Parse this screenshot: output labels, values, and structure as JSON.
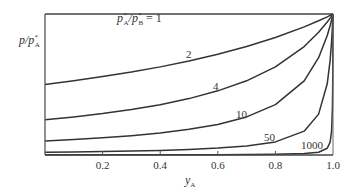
{
  "chart_data": {
    "type": "line",
    "title": "",
    "xlabel": "y_A",
    "xlabel_main": "y",
    "xlabel_sub": "A",
    "ylabel": "p/p*_A",
    "xlim": [
      0,
      1.0
    ],
    "ylim": [
      0,
      1.0
    ],
    "grid": false,
    "legend": "none (curves labelled inline)",
    "x_ticks": [
      0.2,
      0.4,
      0.6,
      0.8,
      1.0
    ],
    "x_tick_labels": [
      "0.2",
      "0.4",
      "0.6",
      "0.8",
      "1.0"
    ],
    "x": [
      0,
      0.1,
      0.2,
      0.3,
      0.4,
      0.5,
      0.6,
      0.7,
      0.8,
      0.9,
      0.95,
      0.98,
      0.99,
      0.995,
      0.998,
      0.999,
      1.0
    ],
    "series": [
      {
        "name": "p*A/p*B = 1",
        "label": "= 1",
        "ratio": 1,
        "values": [
          1,
          1,
          1,
          1,
          1,
          1,
          1,
          1,
          1,
          1,
          1,
          1,
          1,
          1,
          1,
          1,
          1
        ]
      },
      {
        "name": "2",
        "label": "2",
        "ratio": 2,
        "values": [
          0.5,
          0.526,
          0.556,
          0.588,
          0.625,
          0.667,
          0.714,
          0.769,
          0.833,
          0.909,
          0.952,
          0.98,
          0.99,
          0.995,
          0.998,
          0.999,
          1.0
        ]
      },
      {
        "name": "4",
        "label": "4",
        "ratio": 4,
        "values": [
          0.25,
          0.27,
          0.294,
          0.323,
          0.357,
          0.4,
          0.455,
          0.526,
          0.625,
          0.769,
          0.87,
          0.943,
          0.971,
          0.985,
          0.994,
          0.997,
          1.0
        ]
      },
      {
        "name": "10",
        "label": "10",
        "ratio": 10,
        "values": [
          0.1,
          0.11,
          0.122,
          0.137,
          0.156,
          0.182,
          0.217,
          0.27,
          0.357,
          0.526,
          0.69,
          0.847,
          0.917,
          0.957,
          0.982,
          0.991,
          1.0
        ]
      },
      {
        "name": "50",
        "label": "50",
        "ratio": 50,
        "values": [
          0.02,
          0.022,
          0.0245,
          0.028,
          0.032,
          0.039,
          0.049,
          0.064,
          0.093,
          0.169,
          0.29,
          0.505,
          0.671,
          0.803,
          0.911,
          0.953,
          1.0
        ]
      },
      {
        "name": "1000",
        "label": "1000",
        "ratio": 1000,
        "values": [
          0.001,
          0.0011,
          0.00125,
          0.00143,
          0.00167,
          0.002,
          0.0025,
          0.00333,
          0.005,
          0.0099,
          0.0196,
          0.0477,
          0.091,
          0.167,
          0.334,
          0.5,
          1.0
        ]
      }
    ],
    "annotations": [
      {
        "text": "p*A/p*B = 1",
        "near": "top edge, x≈0.3"
      },
      {
        "text": "2",
        "at": [
          0.5,
          0.72
        ]
      },
      {
        "text": "4",
        "at": [
          0.6,
          0.5
        ]
      },
      {
        "text": "10",
        "at": [
          0.68,
          0.28
        ]
      },
      {
        "text": "50",
        "at": [
          0.78,
          0.12
        ]
      },
      {
        "text": "1000",
        "at": [
          0.92,
          0.06
        ]
      }
    ]
  },
  "labels": {
    "top_annotation_p": "p",
    "top_annotation_star_a": "*",
    "top_annotation_sub_a": "A",
    "top_annotation_slash": "/",
    "top_annotation_star_b": "*",
    "top_annotation_sub_b": "B",
    "top_annotation_eq": " = 1",
    "ylabel_p": "p/p",
    "ylabel_star": "*",
    "ylabel_sub": "A",
    "curve_2": "2",
    "curve_4": "4",
    "curve_10": "10",
    "curve_50": "50",
    "curve_1000": "1000"
  }
}
